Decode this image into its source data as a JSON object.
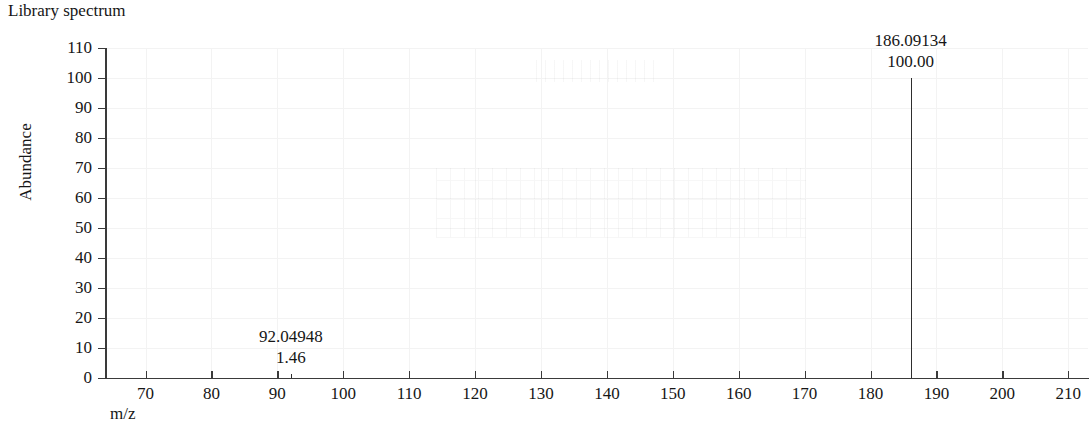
{
  "chart_data": {
    "type": "bar",
    "title": "Library spectrum",
    "xlabel": "m/z",
    "ylabel": "Abundance",
    "xlim": [
      64,
      213
    ],
    "ylim": [
      0,
      110
    ],
    "grid": true,
    "legend": "none",
    "x_ticks": [
      70,
      80,
      90,
      100,
      110,
      120,
      130,
      140,
      150,
      160,
      170,
      180,
      190,
      200,
      210
    ],
    "y_ticks": [
      0,
      10,
      20,
      30,
      40,
      50,
      60,
      70,
      80,
      90,
      100,
      110
    ],
    "x": [
      92.04948,
      186.09134
    ],
    "values": [
      1.46,
      100.0
    ],
    "peaks": [
      {
        "mz": "92.04948",
        "abundance": "1.46",
        "mz_value": 92.04948,
        "abundance_value": 1.46
      },
      {
        "mz": "186.09134",
        "abundance": "100.00",
        "mz_value": 186.09134,
        "abundance_value": 100.0
      }
    ],
    "annotations": [
      {
        "text": "92.04948",
        "x": 92.04948,
        "y": 1.46
      },
      {
        "text": "1.46",
        "x": 92.04948,
        "y": 1.46
      },
      {
        "text": "186.09134",
        "x": 186.09134,
        "y": 100.0
      },
      {
        "text": "100.00",
        "x": 186.09134,
        "y": 100.0
      }
    ]
  },
  "colors": {
    "peak": "#2e2e2e",
    "axis": "#3a3a3a",
    "grid": "#f3f3f3",
    "text": "#161616",
    "background": "#ffffff"
  }
}
